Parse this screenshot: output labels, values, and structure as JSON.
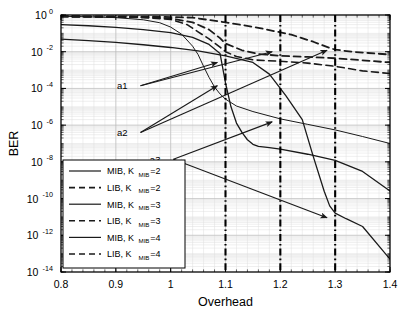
{
  "chart_data": {
    "type": "line",
    "title": "",
    "xlabel": "Overhead",
    "ylabel": "BER",
    "xlim": [
      0.8,
      1.4
    ],
    "ylim": [
      1e-14,
      1.0
    ],
    "yscale": "log",
    "grid": true,
    "xticks": [
      0.8,
      0.9,
      1.0,
      1.1,
      1.2,
      1.3,
      1.4
    ],
    "xticklabels": [
      "0.8",
      "0.9",
      "1",
      "1.1",
      "1.2",
      "1.3",
      "1.4"
    ],
    "yticks": [
      1.0,
      0.01,
      0.0001,
      1e-06,
      1e-08,
      1e-10,
      1e-12,
      1e-14
    ],
    "yticklabels": [
      "10^0",
      "10^-2",
      "10^-4",
      "10^-6",
      "10^-8",
      "10^-10",
      "10^-12",
      "10^-14"
    ],
    "ytick_mantissa": "10",
    "ytick_exponents": [
      "0",
      "-2",
      "-4",
      "-6",
      "-8",
      "-10",
      "-12",
      "-14"
    ],
    "legend_position": "lower left",
    "legend_entries": [
      {
        "label": "MIB, K",
        "sub": "MIB",
        "tail": "=2",
        "style": "solid"
      },
      {
        "label": "LIB, K",
        "sub": "MIB",
        "tail": "=2",
        "style": "dashed"
      },
      {
        "label": "MIB, K",
        "sub": "MIB",
        "tail": "=3",
        "style": "solid"
      },
      {
        "label": "LIB, K",
        "sub": "MIB",
        "tail": "=3",
        "style": "dashed"
      },
      {
        "label": "MIB, K",
        "sub": "MIB",
        "tail": "=4",
        "style": "solid"
      },
      {
        "label": "LIB, K",
        "sub": "MIB",
        "tail": "=4",
        "style": "dashed"
      }
    ],
    "vertical_markers": [
      {
        "x": 1.1,
        "style": "dash-dot"
      },
      {
        "x": 1.2,
        "style": "dash-dot"
      },
      {
        "x": 1.3,
        "style": "dash-dot"
      }
    ],
    "annotations": [
      {
        "text": "a1",
        "x": 0.925,
        "y": 0.00014
      },
      {
        "text": "a2",
        "x": 0.925,
        "y": 4e-07
      },
      {
        "text": "a3",
        "x": 0.985,
        "y": 1.4e-08
      }
    ],
    "arrows": [
      {
        "from_label": "a1",
        "x0": 0.945,
        "y0": 0.00014,
        "x1": 1.085,
        "y1": 0.0026
      },
      {
        "from_label": "a2",
        "x0": 0.945,
        "y0": 4e-07,
        "x1": 1.085,
        "y1": 0.00014
      },
      {
        "from_label": "a3",
        "x0": 1.005,
        "y0": 1.4e-08,
        "x1": 1.185,
        "y1": 1.5e-06
      },
      {
        "from_label": "a1b",
        "x0": 0.945,
        "y0": 0.00014,
        "x1": 1.185,
        "y1": 0.01
      },
      {
        "from_label": "a2b",
        "x0": 0.945,
        "y0": 4e-07,
        "x1": 1.285,
        "y1": 0.012
      },
      {
        "from_label": "a3b",
        "x0": 1.005,
        "y0": 1.4e-08,
        "x1": 1.285,
        "y1": 9e-12
      }
    ],
    "series": [
      {
        "name": "MIB, K_MIB=2",
        "style": "solid",
        "width": 1.0,
        "points": [
          [
            0.8,
            0.85
          ],
          [
            0.85,
            0.8
          ],
          [
            0.9,
            0.72
          ],
          [
            0.95,
            0.55
          ],
          [
            0.98,
            0.38
          ],
          [
            1.0,
            0.22
          ],
          [
            1.02,
            0.09
          ],
          [
            1.04,
            0.02
          ],
          [
            1.05,
            0.007
          ],
          [
            1.06,
            0.0016
          ],
          [
            1.07,
            0.0004
          ],
          [
            1.08,
            0.00012
          ],
          [
            1.09,
            5e-05
          ],
          [
            1.1,
            2.6e-05
          ],
          [
            1.12,
            1.1e-05
          ],
          [
            1.15,
            5.5e-06
          ],
          [
            1.2,
            2.2e-06
          ],
          [
            1.25,
            1.1e-06
          ],
          [
            1.3,
            5.5e-07
          ],
          [
            1.35,
            2.4e-07
          ],
          [
            1.4,
            1e-07
          ]
        ]
      },
      {
        "name": "LIB, K_MIB=2",
        "style": "dashed",
        "width": 1.6,
        "points": [
          [
            0.8,
            0.8
          ],
          [
            0.88,
            0.78
          ],
          [
            0.95,
            0.72
          ],
          [
            1.0,
            0.58
          ],
          [
            1.03,
            0.3
          ],
          [
            1.05,
            0.12
          ],
          [
            1.07,
            0.05
          ],
          [
            1.09,
            0.018
          ],
          [
            1.1,
            0.01
          ],
          [
            1.12,
            0.0055
          ],
          [
            1.15,
            0.0036
          ],
          [
            1.2,
            0.003
          ],
          [
            1.25,
            0.0024
          ],
          [
            1.3,
            0.0016
          ],
          [
            1.35,
            0.0009
          ],
          [
            1.4,
            0.00065
          ]
        ]
      },
      {
        "name": "MIB, K_MIB=3",
        "style": "solid",
        "width": 1.3,
        "points": [
          [
            0.8,
            0.3
          ],
          [
            0.85,
            0.26
          ],
          [
            0.9,
            0.21
          ],
          [
            0.95,
            0.16
          ],
          [
            1.0,
            0.11
          ],
          [
            1.04,
            0.06
          ],
          [
            1.07,
            0.025
          ],
          [
            1.09,
            0.008
          ],
          [
            1.1,
            0.0002
          ],
          [
            1.11,
            1e-05
          ],
          [
            1.12,
            1.3e-06
          ],
          [
            1.13,
            4e-07
          ],
          [
            1.14,
            1.6e-07
          ],
          [
            1.15,
            9e-08
          ],
          [
            1.16,
            7e-08
          ],
          [
            1.18,
            6e-08
          ],
          [
            1.2,
            5e-08
          ],
          [
            1.25,
            2.6e-08
          ],
          [
            1.3,
            1.2e-08
          ],
          [
            1.35,
            3e-09
          ],
          [
            1.4,
            2.6e-10
          ]
        ]
      },
      {
        "name": "LIB, K_MIB=3",
        "style": "dashed",
        "width": 1.8,
        "points": [
          [
            0.8,
            0.82
          ],
          [
            0.88,
            0.8
          ],
          [
            0.95,
            0.76
          ],
          [
            1.0,
            0.66
          ],
          [
            1.04,
            0.4
          ],
          [
            1.07,
            0.16
          ],
          [
            1.09,
            0.055
          ],
          [
            1.1,
            0.028
          ],
          [
            1.13,
            0.012
          ],
          [
            1.16,
            0.0075
          ],
          [
            1.2,
            0.006
          ],
          [
            1.25,
            0.0052
          ],
          [
            1.3,
            0.0044
          ],
          [
            1.35,
            0.0034
          ],
          [
            1.4,
            0.0026
          ]
        ]
      },
      {
        "name": "MIB, K_MIB=4",
        "style": "solid",
        "width": 1.3,
        "points": [
          [
            0.8,
            0.048
          ],
          [
            0.85,
            0.04
          ],
          [
            0.9,
            0.032
          ],
          [
            0.95,
            0.024
          ],
          [
            1.0,
            0.017
          ],
          [
            1.05,
            0.011
          ],
          [
            1.1,
            0.006
          ],
          [
            1.15,
            0.0026
          ],
          [
            1.18,
            0.0006
          ],
          [
            1.21,
            4e-05
          ],
          [
            1.24,
            2e-06
          ],
          [
            1.26,
            2e-08
          ],
          [
            1.28,
            2.5e-10
          ],
          [
            1.29,
            4e-11
          ],
          [
            1.3,
            1.6e-11
          ],
          [
            1.32,
            8e-12
          ],
          [
            1.35,
            3e-12
          ],
          [
            1.4,
            5e-14
          ]
        ]
      },
      {
        "name": "LIB, K_MIB=4",
        "style": "dashed",
        "width": 1.8,
        "points": [
          [
            0.8,
            0.86
          ],
          [
            0.9,
            0.84
          ],
          [
            0.98,
            0.8
          ],
          [
            1.04,
            0.72
          ],
          [
            1.1,
            0.4
          ],
          [
            1.16,
            0.2
          ],
          [
            1.22,
            0.085
          ],
          [
            1.26,
            0.035
          ],
          [
            1.29,
            0.016
          ],
          [
            1.3,
            0.013
          ],
          [
            1.33,
            0.01
          ],
          [
            1.36,
            0.0085
          ],
          [
            1.4,
            0.007
          ]
        ]
      }
    ]
  }
}
